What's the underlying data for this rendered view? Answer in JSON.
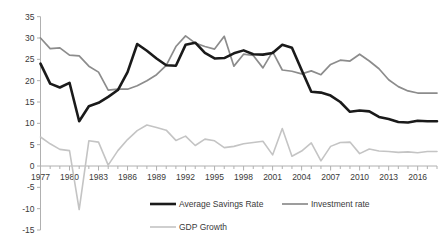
{
  "chart_data": {
    "type": "line",
    "title": "",
    "subtitle": "",
    "xlabel": "",
    "ylabel": "",
    "xlim": [
      1977,
      2018
    ],
    "ylim": [
      -15,
      35
    ],
    "y_ticks": [
      35,
      30,
      25,
      20,
      15,
      10,
      5,
      0,
      -5,
      -10,
      -15
    ],
    "y_tick_labels": [
      "35",
      "30",
      "25",
      "20",
      "15",
      "10",
      "5",
      "0",
      "-5",
      "-10",
      "-15"
    ],
    "x_ticks": [
      1977,
      1980,
      1983,
      1986,
      1989,
      1992,
      1995,
      1998,
      2001,
      2004,
      2007,
      2010,
      2013,
      2016
    ],
    "x_tick_labels": [
      "1977",
      "1980",
      "1983",
      "1986",
      "1989",
      "1992",
      "1995",
      "1998",
      "2001",
      "2004",
      "2007",
      "2010",
      "2013",
      "2016"
    ],
    "x_minor_tick_interval": 1,
    "grid": false,
    "legend_position": "bottom",
    "x": [
      1977,
      1978,
      1979,
      1980,
      1981,
      1982,
      1983,
      1984,
      1985,
      1986,
      1987,
      1988,
      1989,
      1990,
      1991,
      1992,
      1993,
      1994,
      1995,
      1996,
      1997,
      1998,
      1999,
      2000,
      2001,
      2002,
      2003,
      2004,
      2005,
      2006,
      2007,
      2008,
      2009,
      2010,
      2011,
      2012,
      2013,
      2014,
      2015,
      2016,
      2017,
      2018
    ],
    "series": [
      {
        "name": "Average Savings Rate",
        "color": "#1a1a1a",
        "width": 2.6,
        "values": [
          24.0,
          19.3,
          18.4,
          19.5,
          10.5,
          14.0,
          14.8,
          16.2,
          17.8,
          22.0,
          28.6,
          27.0,
          25.2,
          23.6,
          23.5,
          28.4,
          28.9,
          26.5,
          25.2,
          25.3,
          26.4,
          27.1,
          26.2,
          26.1,
          26.5,
          28.4,
          27.7,
          22.5,
          17.4,
          17.2,
          16.5,
          15.0,
          12.7,
          13.0,
          12.8,
          11.5,
          11.0,
          10.3,
          10.2,
          10.6,
          10.5,
          10.5
        ]
      },
      {
        "name": "Investment rate",
        "color": "#8c8c8c",
        "width": 1.7,
        "values": [
          30.0,
          27.5,
          27.7,
          26.0,
          25.8,
          23.4,
          22.0,
          17.8,
          18.0,
          18.0,
          18.8,
          20.0,
          21.4,
          23.6,
          28.0,
          30.5,
          28.8,
          28.0,
          27.4,
          30.4,
          23.4,
          26.2,
          25.9,
          23.0,
          26.8,
          22.5,
          22.2,
          21.6,
          22.3,
          21.4,
          23.8,
          24.8,
          24.6,
          26.2,
          24.6,
          22.8,
          20.2,
          18.6,
          17.6,
          17.1,
          17.1,
          17.1
        ]
      },
      {
        "name": "GDP Growth",
        "color": "#c4c4c4",
        "width": 1.6,
        "values": [
          6.8,
          5.2,
          3.9,
          3.6,
          -10.2,
          5.9,
          5.6,
          0.2,
          3.6,
          6.2,
          8.3,
          9.6,
          9.0,
          8.4,
          6.0,
          7.0,
          4.8,
          6.3,
          5.9,
          4.3,
          4.6,
          5.2,
          5.5,
          5.8,
          2.6,
          8.8,
          2.3,
          3.5,
          5.4,
          1.2,
          4.6,
          5.5,
          5.6,
          2.9,
          4.0,
          3.5,
          3.4,
          3.2,
          3.3,
          3.1,
          3.4,
          3.4
        ]
      }
    ]
  },
  "legend": {
    "items": [
      {
        "label": "Average Savings Rate"
      },
      {
        "label": "Investment rate"
      },
      {
        "label": "GDP Growth"
      }
    ]
  }
}
